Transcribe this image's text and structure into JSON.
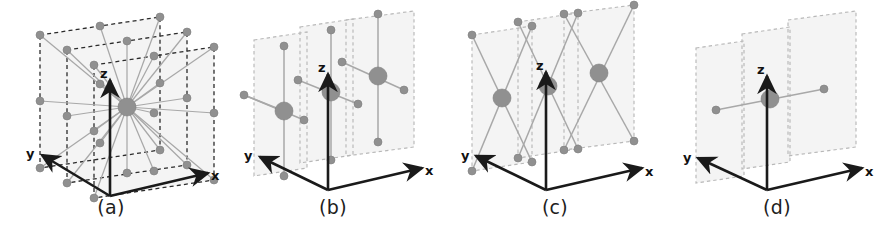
{
  "figure": {
    "background": "#ffffff",
    "width": 887,
    "height": 234,
    "panel_count": 4
  },
  "style": {
    "axis_color": "#1a1a1a",
    "plane_fill": "#f4f4f4",
    "plane_fill_dark": "#f0f0f0",
    "plane_edge_light": "#b8b8b8",
    "plane_edge_dark": "#2b2b2b",
    "edge_color": "#a8a8a8",
    "edge_color_dark": "#9a9a9a",
    "node_color": "#909090",
    "node_stroke": "#7d7d7d",
    "caption_color": "#1d1d1d"
  },
  "axes": {
    "x_label": "x",
    "y_label": "y",
    "z_label": "z"
  },
  "panels": [
    {
      "id": "panel-a",
      "caption": "(a)",
      "name": "full-star-connectivity",
      "plane_edge_style": "dashed-dark",
      "description": "Center hub node connected to all nodes on three parallel planes",
      "node_count": 27,
      "hub_radius": 9,
      "node_radius": 4,
      "edge_pattern": "star-from-center-to-all"
    },
    {
      "id": "panel-b",
      "caption": "(b)",
      "name": "axial-cross-connectivity",
      "plane_edge_style": "dashed-light",
      "description": "Three large nodes each connected to four axis-aligned neighbors",
      "node_count": 15,
      "hub_radius": 9,
      "node_radius": 4,
      "edge_pattern": "plus-cross-per-plane"
    },
    {
      "id": "panel-c",
      "caption": "(c)",
      "name": "diagonal-connectivity",
      "plane_edge_style": "dashed-light",
      "description": "Three large nodes each connected to four diagonal corner neighbors",
      "node_count": 15,
      "hub_radius": 9,
      "node_radius": 4,
      "edge_pattern": "diagonal-x-per-plane"
    },
    {
      "id": "panel-d",
      "caption": "(d)",
      "name": "single-axis-connectivity",
      "plane_edge_style": "dashed-light",
      "description": "Single center node connected to two neighbors along one axis",
      "node_count": 3,
      "hub_radius": 9,
      "node_radius": 4,
      "edge_pattern": "single-line-through-planes"
    }
  ]
}
